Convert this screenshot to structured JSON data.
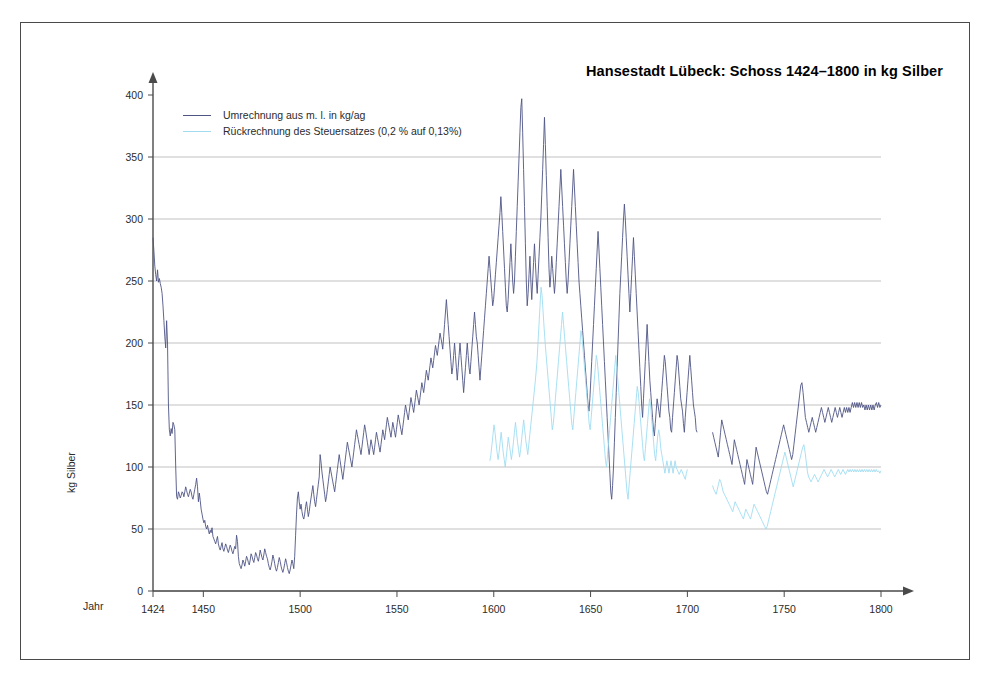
{
  "chart_data": {
    "type": "line",
    "title": "Hansestadt Lübeck: Schoss 1424–1800 in kg Silber",
    "xlabel": "Jahr",
    "ylabel": "kg Silber",
    "xlim": [
      1424,
      1800
    ],
    "ylim": [
      0,
      400
    ],
    "xticks": [
      1424,
      1450,
      1500,
      1550,
      1600,
      1650,
      1700,
      1750,
      1800
    ],
    "yticks": [
      0,
      50,
      100,
      150,
      200,
      250,
      300,
      350,
      400
    ],
    "grid": "horizontal",
    "legend_position": "top-left",
    "colors": {
      "series1": "#4e5584",
      "series2": "#9fdcf2",
      "axis": "#4a4a4a",
      "gridline": "#9a9a9a",
      "frame": "#4a4a4a",
      "text": "#2b2b2b"
    },
    "series": [
      {
        "name": "Umrechnung aus m. l. in kg/ag",
        "color": "#4e5584",
        "x_start": 1424,
        "values": [
          285,
          274,
          262,
          255,
          250,
          259,
          249,
          252,
          248,
          245,
          240,
          230,
          218,
          205,
          196,
          218,
          200,
          150,
          130,
          125,
          131,
          127,
          136,
          134,
          130,
          100,
          76,
          74,
          80,
          78,
          75,
          77,
          80,
          79,
          76,
          80,
          84,
          81,
          78,
          76,
          79,
          82,
          80,
          76,
          74,
          78,
          82,
          86,
          91,
          84,
          72,
          79,
          73,
          66,
          62,
          58,
          55,
          57,
          52,
          50,
          53,
          49,
          46,
          49,
          47,
          51,
          44,
          42,
          40,
          38,
          41,
          44,
          38,
          35,
          33,
          36,
          39,
          34,
          32,
          35,
          38,
          36,
          33,
          31,
          34,
          37,
          35,
          32,
          30,
          33,
          36,
          34,
          45,
          40,
          28,
          22,
          20,
          18,
          21,
          25,
          23,
          20,
          24,
          28,
          26,
          23,
          21,
          25,
          30,
          28,
          25,
          23,
          27,
          31,
          29,
          26,
          24,
          28,
          33,
          30,
          27,
          25,
          29,
          34,
          31,
          28,
          26,
          22,
          19,
          17,
          20,
          24,
          29,
          26,
          22,
          18,
          16,
          19,
          23,
          27,
          24,
          20,
          17,
          15,
          18,
          22,
          26,
          23,
          19,
          16,
          14,
          17,
          21,
          25,
          22,
          18,
          28,
          45,
          62,
          75,
          80,
          72,
          66,
          70,
          64,
          60,
          58,
          62,
          68,
          72,
          66,
          60,
          64,
          70,
          75,
          80,
          85,
          78,
          72,
          68,
          74,
          80,
          86,
          92,
          110,
          104,
          96,
          90,
          84,
          78,
          72,
          76,
          82,
          88,
          94,
          100,
          96,
          92,
          88,
          84,
          80,
          86,
          92,
          98,
          104,
          110,
          105,
          100,
          95,
          90,
          96,
          102,
          108,
          114,
          120,
          116,
          112,
          108,
          104,
          100,
          106,
          112,
          118,
          124,
          130,
          126,
          122,
          118,
          114,
          110,
          116,
          122,
          128,
          134,
          130,
          125,
          120,
          115,
          110,
          116,
          122,
          118,
          114,
          110,
          116,
          122,
          128,
          124,
          120,
          116,
          112,
          118,
          124,
          130,
          126,
          122,
          128,
          134,
          140,
          136,
          132,
          128,
          124,
          130,
          136,
          132,
          128,
          124,
          130,
          136,
          142,
          138,
          134,
          130,
          126,
          132,
          138,
          144,
          150,
          146,
          142,
          138,
          144,
          150,
          156,
          152,
          148,
          144,
          150,
          156,
          162,
          158,
          154,
          150,
          156,
          162,
          168,
          164,
          160,
          166,
          172,
          178,
          174,
          170,
          176,
          182,
          188,
          184,
          180,
          186,
          192,
          198,
          194,
          190,
          196,
          202,
          208,
          204,
          200,
          195,
          205,
          215,
          225,
          235,
          225,
          215,
          205,
          195,
          185,
          175,
          180,
          190,
          200,
          190,
          180,
          170,
          180,
          190,
          200,
          190,
          180,
          170,
          160,
          170,
          180,
          190,
          200,
          190,
          180,
          175,
          185,
          195,
          205,
          215,
          225,
          215,
          205,
          200,
          190,
          180,
          170,
          180,
          190,
          200,
          210,
          220,
          230,
          240,
          250,
          260,
          270,
          260,
          250,
          240,
          230,
          235,
          245,
          255,
          265,
          275,
          285,
          295,
          305,
          318,
          305,
          290,
          275,
          260,
          245,
          230,
          225,
          235,
          250,
          265,
          280,
          265,
          250,
          240,
          250,
          270,
          290,
          310,
          330,
          350,
          370,
          390,
          397,
          370,
          340,
          310,
          280,
          250,
          230,
          240,
          255,
          270,
          250,
          235,
          250,
          265,
          280,
          265,
          250,
          240,
          255,
          270,
          285,
          300,
          320,
          340,
          360,
          382,
          360,
          335,
          310,
          285,
          260,
          245,
          255,
          270,
          260,
          250,
          240,
          250,
          265,
          280,
          295,
          310,
          325,
          340,
          325,
          310,
          295,
          280,
          265,
          250,
          240,
          250,
          265,
          280,
          295,
          310,
          325,
          340,
          325,
          310,
          295,
          280,
          265,
          250,
          240,
          230,
          220,
          210,
          200,
          190,
          180,
          170,
          160,
          150,
          145,
          155,
          170,
          185,
          200,
          215,
          230,
          245,
          260,
          275,
          290,
          275,
          260,
          245,
          230,
          215,
          200,
          185,
          170,
          155,
          140,
          125,
          110,
          95,
          80,
          74,
          85,
          100,
          120,
          140,
          160,
          180,
          200,
          220,
          240,
          255,
          270,
          285,
          300,
          312,
          300,
          285,
          270,
          255,
          240,
          225,
          240,
          255,
          270,
          285,
          270,
          255,
          240,
          225,
          210,
          195,
          180,
          165,
          150,
          140,
          155,
          170,
          185,
          200,
          215,
          200,
          185,
          170,
          160,
          150,
          140,
          130,
          125,
          135,
          145,
          155,
          150,
          145,
          140,
          150,
          160,
          170,
          180,
          190,
          185,
          175,
          165,
          155,
          145,
          140,
          130,
          128,
          140,
          150,
          160,
          170,
          180,
          190,
          185,
          175,
          165,
          155,
          150,
          145,
          135,
          128,
          140,
          150,
          160,
          170,
          180,
          190,
          180,
          170,
          160,
          150,
          145,
          140,
          130,
          128
        ],
        "segment2_note": "Series resumes after a gap around 1705-1712",
        "values_b_start": 1713,
        "values_b": [
          128,
          124,
          120,
          116,
          112,
          108,
          118,
          128,
          138,
          134,
          130,
          126,
          122,
          118,
          114,
          110,
          106,
          102,
          112,
          122,
          118,
          114,
          110,
          106,
          102,
          98,
          94,
          90,
          86,
          96,
          106,
          102,
          98,
          94,
          90,
          86,
          96,
          106,
          116,
          112,
          108,
          104,
          100,
          96,
          92,
          88,
          84,
          80,
          78,
          82,
          86,
          90,
          94,
          98,
          102,
          106,
          110,
          114,
          118,
          122,
          126,
          130,
          134,
          130,
          126,
          122,
          118,
          114,
          110,
          106,
          110,
          118,
          126,
          134,
          142,
          150,
          158,
          166,
          168,
          160,
          150,
          140,
          136,
          132,
          128,
          132,
          136,
          140,
          136,
          132,
          128,
          132,
          136,
          140,
          144,
          148,
          144,
          140,
          136,
          140,
          144,
          148,
          144,
          140,
          136,
          140,
          144,
          148,
          144,
          140,
          144,
          148,
          144,
          140,
          144,
          148,
          144,
          148,
          144,
          148,
          144,
          148,
          152,
          148,
          152,
          148,
          152,
          148,
          152,
          148,
          152,
          148,
          150,
          146,
          150,
          146,
          150,
          146,
          150,
          146,
          150,
          146,
          150,
          152,
          148,
          152,
          148,
          150
        ]
      },
      {
        "name": "Rückrechnung des Steuersatzes (0,2 % auf 0,13%)",
        "color": "#9fdcf2",
        "x_start": 1598,
        "values": [
          105,
          110,
          118,
          126,
          134,
          128,
          120,
          112,
          106,
          112,
          120,
          128,
          120,
          112,
          106,
          100,
          108,
          116,
          124,
          118,
          112,
          106,
          112,
          120,
          128,
          136,
          128,
          120,
          114,
          108,
          114,
          122,
          130,
          138,
          130,
          122,
          116,
          110,
          118,
          126,
          134,
          142,
          150,
          158,
          166,
          175,
          185,
          200,
          215,
          230,
          245,
          238,
          225,
          212,
          200,
          190,
          180,
          170,
          160,
          150,
          140,
          130,
          135,
          145,
          155,
          165,
          175,
          185,
          195,
          205,
          215,
          225,
          215,
          205,
          195,
          185,
          175,
          165,
          155,
          145,
          135,
          130,
          140,
          150,
          160,
          170,
          180,
          190,
          200,
          210,
          205,
          195,
          185,
          175,
          165,
          155,
          145,
          135,
          130,
          140,
          150,
          160,
          170,
          180,
          190,
          185,
          175,
          165,
          155,
          145,
          135,
          125,
          115,
          105,
          100,
          110,
          120,
          130,
          140,
          150,
          160,
          170,
          180,
          190,
          180,
          170,
          160,
          150,
          140,
          130,
          120,
          110,
          100,
          90,
          80,
          74,
          85,
          95,
          105,
          115,
          125,
          135,
          145,
          155,
          165,
          160,
          150,
          140,
          130,
          120,
          110,
          105,
          115,
          125,
          135,
          145,
          155,
          150,
          140,
          130,
          120,
          110,
          105,
          115,
          125,
          130,
          125,
          115,
          110,
          105,
          100,
          95,
          100,
          105,
          100,
          95,
          100,
          105,
          100,
          95,
          100,
          105,
          100,
          98,
          96,
          94,
          96,
          98,
          96,
          94,
          92,
          90,
          95,
          98
        ],
        "values_b_start": 1713,
        "values_b": [
          85,
          82,
          80,
          78,
          82,
          86,
          90,
          88,
          84,
          80,
          78,
          76,
          74,
          72,
          70,
          68,
          66,
          64,
          68,
          72,
          70,
          68,
          66,
          64,
          62,
          60,
          58,
          62,
          66,
          64,
          62,
          60,
          58,
          62,
          66,
          70,
          68,
          66,
          64,
          62,
          60,
          58,
          56,
          54,
          52,
          50,
          52,
          56,
          60,
          64,
          68,
          72,
          76,
          80,
          84,
          88,
          92,
          96,
          100,
          104,
          108,
          112,
          108,
          104,
          100,
          96,
          92,
          88,
          84,
          88,
          92,
          96,
          100,
          104,
          108,
          112,
          116,
          118,
          112,
          104,
          96,
          92,
          90,
          88,
          90,
          92,
          94,
          92,
          90,
          88,
          90,
          92,
          94,
          96,
          98,
          96,
          94,
          92,
          94,
          96,
          98,
          96,
          94,
          92,
          94,
          96,
          98,
          96,
          94,
          96,
          98,
          96,
          94,
          96,
          98,
          96,
          98,
          96,
          98,
          96,
          98,
          96,
          98,
          96,
          98,
          96,
          98,
          96,
          98,
          96,
          98,
          96,
          98,
          96,
          98,
          96,
          98,
          96,
          98,
          96,
          97,
          95,
          97
        ]
      }
    ]
  },
  "title": {
    "text": "Hansestadt Lübeck: Schoss 1424–1800 in kg Silber"
  },
  "legend": {
    "items": [
      {
        "label": "Umrechnung aus m. l. in kg/ag",
        "color": "#4e5584"
      },
      {
        "label": "Rückrechnung des Steuersatzes (0,2 % auf 0,13%)",
        "color": "#9fdcf2"
      }
    ]
  },
  "axes": {
    "y_title": "kg Silber",
    "x_title": "Jahr",
    "y_ticks": [
      "0",
      "50",
      "100",
      "150",
      "200",
      "250",
      "300",
      "350",
      "400"
    ],
    "x_ticks": [
      "1424",
      "1450",
      "1500",
      "1550",
      "1600",
      "1650",
      "1700",
      "1750",
      "1800"
    ]
  }
}
